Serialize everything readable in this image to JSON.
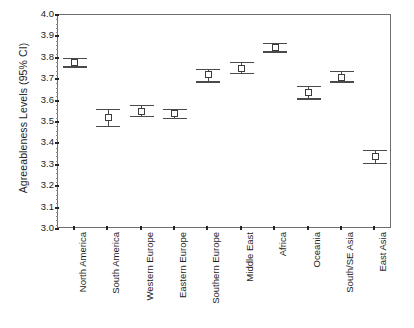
{
  "chart_data": {
    "type": "scatter",
    "title": "",
    "xlabel": "",
    "ylabel": "Agreeableness Levels (95% CI)",
    "ylim": [
      3.0,
      4.0
    ],
    "ytick_step": 0.1,
    "grid": false,
    "legend": "none",
    "error_type": "95% CI",
    "marker": "open-square",
    "categories": [
      "North America",
      "South America",
      "Western Europe",
      "Eastern Europe",
      "Southern Europe",
      "Middle East",
      "Africa",
      "Oceania",
      "South/SE Asia",
      "East Asia"
    ],
    "values": [
      3.78,
      3.52,
      3.55,
      3.54,
      3.72,
      3.75,
      3.85,
      3.64,
      3.71,
      3.34
    ],
    "ci_lower": [
      3.76,
      3.48,
      3.53,
      3.52,
      3.69,
      3.73,
      3.83,
      3.61,
      3.69,
      3.31
    ],
    "ci_upper": [
      3.8,
      3.56,
      3.58,
      3.56,
      3.75,
      3.78,
      3.87,
      3.67,
      3.74,
      3.37
    ],
    "ytick_labels": [
      "4.0",
      "3.9",
      "3.8",
      "3.7",
      "3.6",
      "3.5",
      "3.4",
      "3.3",
      "3.2",
      "3.1",
      "3.0"
    ],
    "ytick_values": [
      4.0,
      3.9,
      3.8,
      3.7,
      3.6,
      3.5,
      3.4,
      3.3,
      3.2,
      3.1,
      3.0
    ],
    "colors": {
      "marker_edge": "#3c3c3c",
      "marker_face": "#ffffff",
      "error_bar": "#4a4a4a",
      "axis": "#6e6e6e",
      "text": "#1d1d1d",
      "background": "#ffffff"
    }
  }
}
